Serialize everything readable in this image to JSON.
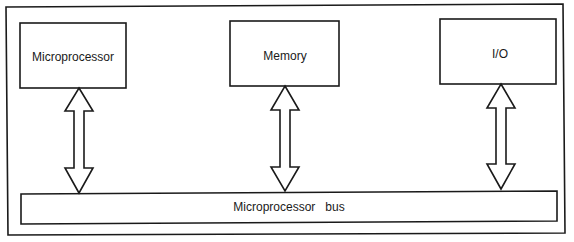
{
  "diagram": {
    "title": "",
    "blocks": [
      {
        "id": "microprocessor",
        "label": "Microprocessor"
      },
      {
        "id": "memory",
        "label": "Memory"
      },
      {
        "id": "io",
        "label": "I/O"
      }
    ],
    "bus": {
      "label": "Microprocessor   bus"
    },
    "connections": [
      {
        "from": "microprocessor",
        "to": "bus",
        "type": "bidirectional-arrow"
      },
      {
        "from": "memory",
        "to": "bus",
        "type": "bidirectional-arrow"
      },
      {
        "from": "io",
        "to": "bus",
        "type": "bidirectional-arrow"
      }
    ],
    "colors": {
      "stroke": "#1a1a1a",
      "fill": "#ffffff"
    }
  }
}
